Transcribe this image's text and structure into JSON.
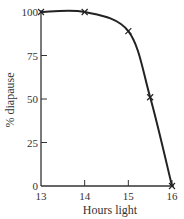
{
  "chart_data": {
    "type": "line",
    "title": "",
    "xlabel": "Hours light",
    "ylabel": "% diapause",
    "xlim": [
      13,
      16
    ],
    "ylim": [
      0,
      100
    ],
    "x_ticks": [
      "13",
      "14",
      "15",
      "16"
    ],
    "y_ticks": [
      "0",
      "25",
      "50",
      "75",
      "100"
    ],
    "grid": false,
    "legend": null,
    "marker": "x",
    "series": [
      {
        "name": "% diapause",
        "x": [
          13,
          14,
          15,
          15.5,
          16
        ],
        "y": [
          100,
          100,
          89,
          51,
          0
        ]
      }
    ]
  },
  "colors": {
    "line": "#222222",
    "axis": "#333333",
    "background": "#ffffff"
  }
}
